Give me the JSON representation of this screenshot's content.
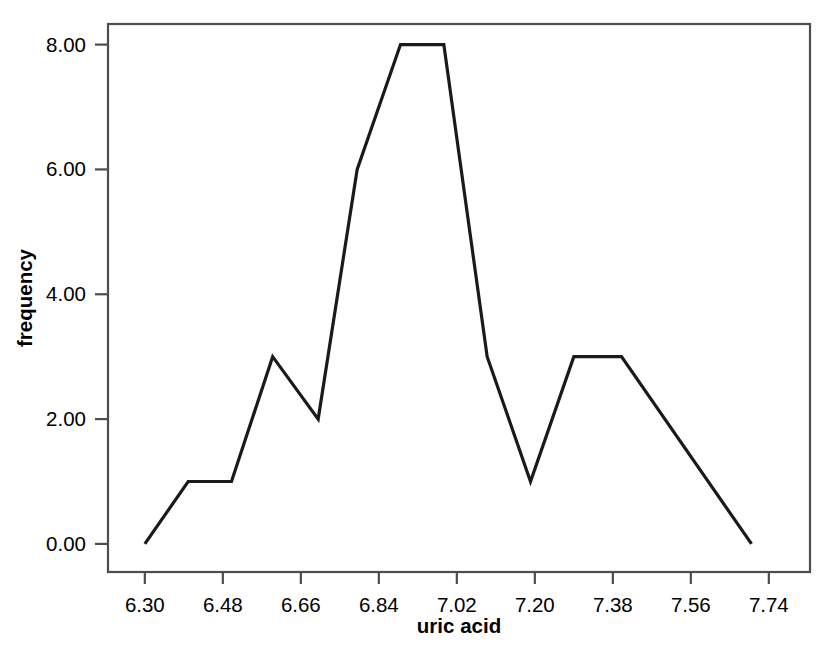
{
  "chart_data": {
    "type": "line",
    "title": "",
    "subtitle": "",
    "xlabel": "uric acid",
    "ylabel": "frequency",
    "xlim": [
      6.215,
      7.835
    ],
    "ylim": [
      -0.45,
      8.33
    ],
    "grid": false,
    "legend": null,
    "annotations": [],
    "x_ticks": [
      6.3,
      6.48,
      6.66,
      6.84,
      7.02,
      7.2,
      7.38,
      7.56,
      7.74
    ],
    "x_tick_labels": [
      "6.30",
      "6.48",
      "6.66",
      "6.84",
      "7.02",
      "7.20",
      "7.38",
      "7.56",
      "7.74"
    ],
    "y_ticks": [
      0,
      2,
      4,
      6,
      8
    ],
    "y_tick_labels": [
      "0.00",
      "2.00",
      "4.00",
      "6.00",
      "8.00"
    ],
    "line_color": "#1a1a1a",
    "series": [
      {
        "name": "frequency",
        "x": [
          6.3,
          6.4,
          6.5,
          6.595,
          6.7,
          6.79,
          6.89,
          6.99,
          7.09,
          7.19,
          7.29,
          7.4,
          7.7
        ],
        "values": [
          0,
          1,
          1,
          3,
          2,
          6,
          8,
          8,
          3,
          1,
          3,
          3,
          0
        ]
      }
    ]
  },
  "axis": {
    "x_title": "uric acid",
    "y_title": "frequency"
  },
  "colors": {
    "line": "#1a1a1a",
    "frame": "#4d4d4d",
    "background": "#ffffff",
    "text": "#000000"
  }
}
